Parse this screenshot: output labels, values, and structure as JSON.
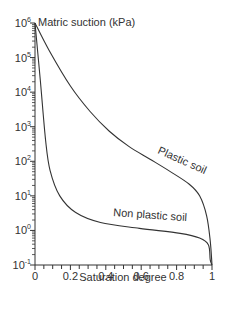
{
  "chart_data": {
    "type": "line",
    "title": "",
    "xlabel": "Saturation degree",
    "ylabel": "Matric suction (kPa)",
    "xlim": [
      0,
      1
    ],
    "ylim": [
      0.1,
      1000000
    ],
    "yscale": "log",
    "grid": false,
    "x_ticks": [
      "0",
      "0.2",
      "0.4",
      "0.6",
      "0.8",
      "1"
    ],
    "y_ticks": [
      {
        "base": "10",
        "exp": "6"
      },
      {
        "base": "10",
        "exp": "5"
      },
      {
        "base": "10",
        "exp": "4"
      },
      {
        "base": "10",
        "exp": "3"
      },
      {
        "base": "10",
        "exp": "2"
      },
      {
        "base": "10",
        "exp": "1"
      },
      {
        "base": "10",
        "exp": "0"
      },
      {
        "base": "10",
        "exp": "-1"
      }
    ],
    "series": [
      {
        "name": "Plastic soil",
        "x": [
          0.0,
          0.08,
          0.2,
          0.31,
          0.42,
          0.53,
          0.65,
          0.76,
          0.87,
          0.93,
          0.97,
          0.99,
          1.0
        ],
        "y": [
          1000000,
          160000,
          15000,
          2800,
          740,
          270,
          115,
          52,
          22,
          10,
          2.6,
          0.5,
          0.1
        ]
      },
      {
        "name": "Non plastic soil",
        "x": [
          0.0,
          0.03,
          0.06,
          0.085,
          0.14,
          0.23,
          0.37,
          0.59,
          0.82,
          0.93,
          0.98,
          0.99,
          1.0
        ],
        "y": [
          1000000,
          22000,
          400,
          55,
          10,
          3.3,
          1.7,
          1.15,
          0.82,
          0.6,
          0.38,
          0.14,
          0.1
        ]
      }
    ],
    "annotations": [
      "Plastic soil",
      "Non plastic soil"
    ]
  }
}
